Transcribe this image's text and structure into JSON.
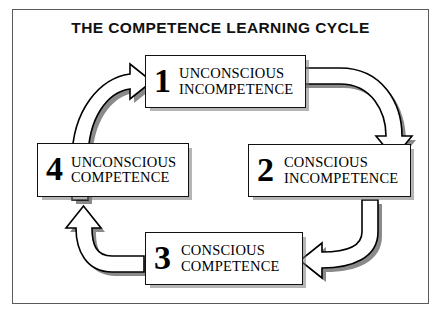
{
  "diagram": {
    "title": "THE COMPETENCE LEARNING CYCLE",
    "type": "cycle",
    "frame_color": "#5a5a5a",
    "box_border_color": "#111111",
    "shadow_color": "#787878",
    "nodes": [
      {
        "number": "1",
        "line1": "UNCONSCIOUS",
        "line2": "INCOMPETENCE",
        "position": "top"
      },
      {
        "number": "2",
        "line1": "CONSCIOUS",
        "line2": "INCOMPETENCE",
        "position": "right"
      },
      {
        "number": "3",
        "line1": "CONSCIOUS",
        "line2": "COMPETENCE",
        "position": "bottom"
      },
      {
        "number": "4",
        "line1": "UNCONSCIOUS",
        "line2": "COMPETENCE",
        "position": "left"
      }
    ],
    "arrows": [
      {
        "from": "1",
        "to": "2",
        "name": "arrow-1-to-2",
        "direction": "down"
      },
      {
        "from": "2",
        "to": "3",
        "name": "arrow-2-to-3",
        "direction": "left"
      },
      {
        "from": "3",
        "to": "4",
        "name": "arrow-3-to-4",
        "direction": "up"
      },
      {
        "from": "4",
        "to": "1",
        "name": "arrow-4-to-1",
        "direction": "right"
      }
    ]
  }
}
